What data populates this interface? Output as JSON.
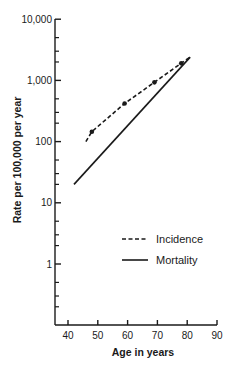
{
  "chart_data": {
    "type": "line",
    "title": "",
    "xlabel": "Age in years",
    "ylabel": "Rate per 100,000 per year",
    "yscale": "log",
    "xlim": [
      40,
      90
    ],
    "ylim": [
      0.1,
      10000
    ],
    "x_ticks": [
      40,
      50,
      60,
      70,
      80,
      90
    ],
    "x_tick_labels": [
      "40",
      "50",
      "60",
      "70",
      "80",
      "90"
    ],
    "y_ticks": [
      1,
      10,
      100,
      1000,
      10000
    ],
    "y_tick_labels": [
      "1",
      "10",
      "100",
      "1,000",
      "10,000"
    ],
    "grid": false,
    "legend_position": "lower right (inside)",
    "series": [
      {
        "name": "Incidence",
        "style": "dashed",
        "markers": [
          {
            "x": 48,
            "y": 145
          },
          {
            "x": 59,
            "y": 420
          },
          {
            "x": 69,
            "y": 930
          },
          {
            "x": 78,
            "y": 1900
          }
        ],
        "line": [
          {
            "x": 46,
            "y": 100
          },
          {
            "x": 48,
            "y": 145
          },
          {
            "x": 59,
            "y": 420
          },
          {
            "x": 69,
            "y": 930
          },
          {
            "x": 78,
            "y": 1900
          },
          {
            "x": 81,
            "y": 2400
          }
        ]
      },
      {
        "name": "Mortality",
        "style": "solid",
        "line": [
          {
            "x": 42,
            "y": 20
          },
          {
            "x": 81,
            "y": 2400
          }
        ]
      }
    ]
  },
  "legend": {
    "items": [
      {
        "label": "Incidence",
        "style": "dashed"
      },
      {
        "label": "Mortality",
        "style": "solid"
      }
    ]
  },
  "colors": {
    "ink": "#1a1a1a",
    "background": "#ffffff"
  }
}
